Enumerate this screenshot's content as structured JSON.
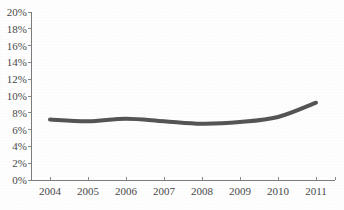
{
  "chart_data": {
    "type": "line",
    "title": "",
    "subtitle": "",
    "xlabel": "",
    "ylabel": "",
    "categories": [
      "2004",
      "2005",
      "2006",
      "2007",
      "2008",
      "2009",
      "2010",
      "2011"
    ],
    "series": [
      {
        "name": "series-1",
        "values": [
          7.2,
          7.0,
          7.3,
          7.0,
          6.7,
          6.9,
          7.5,
          9.2
        ],
        "color": "#555555"
      }
    ],
    "x": [
      2004,
      2005,
      2006,
      2007,
      2008,
      2009,
      2010,
      2011
    ],
    "ylim": [
      0,
      20
    ],
    "ytick_values": [
      0,
      2,
      4,
      6,
      8,
      10,
      12,
      14,
      16,
      18,
      20
    ],
    "ytick_labels": [
      "0%",
      "2%",
      "4%",
      "6%",
      "8%",
      "10%",
      "12%",
      "14%",
      "16%",
      "18%",
      "20%"
    ],
    "xtick_labels": [
      "2004",
      "2005",
      "2006",
      "2007",
      "2008",
      "2009",
      "2010",
      "2011"
    ],
    "grid": false,
    "legend": false,
    "legend_position": "none",
    "annotations": []
  },
  "style": {
    "line_color": "#555555",
    "axis_color": "#7d7d7d",
    "tick_color": "#8a8a8a",
    "label_color": "#4a4a4a",
    "background": "#ffffff",
    "line_width": "4"
  },
  "geometry": {
    "plot_left": 31,
    "plot_right": 335,
    "plot_top": 12,
    "plot_bottom": 180
  }
}
